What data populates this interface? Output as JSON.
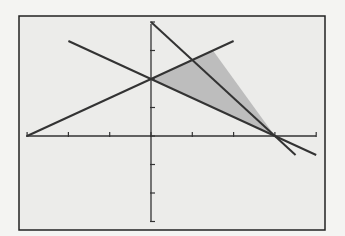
{
  "chart_data": {
    "type": "line",
    "title": "",
    "xlabel": "",
    "ylabel": "",
    "xlim": [
      -3,
      4
    ],
    "ylim": [
      -3,
      4
    ],
    "x_tick_step": 1,
    "y_tick_step": 1,
    "grid": false,
    "legend": "none",
    "series": [
      {
        "name": "line-1 (positive slope)",
        "equation": "y = (2/3)x + 2",
        "x": [
          -3,
          2
        ],
        "y": [
          0,
          3.333
        ]
      },
      {
        "name": "line-2 (shallow negative slope)",
        "equation": "y = -(2/3)x + 2",
        "x": [
          -2,
          4
        ],
        "y": [
          3.333,
          -0.667
        ]
      },
      {
        "name": "line-3 (steep negative slope)",
        "equation": "y = -(4/3)x + 4",
        "x": [
          0,
          3.5
        ],
        "y": [
          4,
          -0.667
        ]
      }
    ],
    "shaded_region": {
      "description": "feasible triangle",
      "vertices": [
        [
          0,
          2
        ],
        [
          1.5,
          3
        ],
        [
          3,
          0
        ]
      ],
      "color": "#c0c0c0"
    },
    "colors": {
      "background": "#f4f4f2",
      "frame": "#222222",
      "lines": "#333333",
      "fill": "#bdbdbd"
    }
  }
}
